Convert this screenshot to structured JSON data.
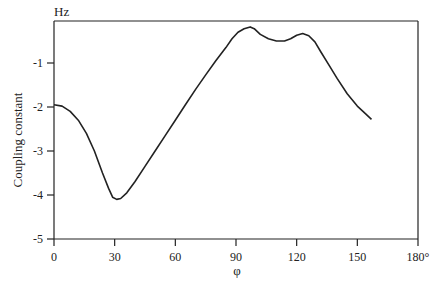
{
  "chart_data": {
    "type": "line",
    "title": "",
    "xlabel": "φ",
    "ylabel": "Coupling constant",
    "yunit": "Hz",
    "xlim": [
      0,
      180
    ],
    "ylim": [
      -5,
      0
    ],
    "x_ticks": [
      {
        "value": 0,
        "label": "0"
      },
      {
        "value": 30,
        "label": "30"
      },
      {
        "value": 60,
        "label": "60"
      },
      {
        "value": 90,
        "label": "90"
      },
      {
        "value": 120,
        "label": "120"
      },
      {
        "value": 150,
        "label": "150"
      },
      {
        "value": 180,
        "label": "180°"
      }
    ],
    "y_ticks": [
      {
        "value": -1,
        "label": "-1"
      },
      {
        "value": -2,
        "label": "-2"
      },
      {
        "value": -3,
        "label": "-3"
      },
      {
        "value": -4,
        "label": "-4"
      },
      {
        "value": -5,
        "label": "-5"
      }
    ],
    "grid": false,
    "legend": null,
    "series": [
      {
        "name": "Coupling constant vs φ",
        "color": "#222222",
        "x": [
          0,
          4,
          8,
          12,
          16,
          20,
          24,
          27,
          29,
          31,
          33,
          36,
          40,
          45,
          50,
          55,
          60,
          65,
          70,
          75,
          80,
          85,
          88,
          91,
          94,
          97,
          99,
          102,
          106,
          110,
          114,
          117,
          120,
          123,
          126,
          129,
          132,
          136,
          140,
          145,
          150,
          154,
          157
        ],
        "values": [
          -1.95,
          -1.98,
          -2.1,
          -2.3,
          -2.6,
          -3.0,
          -3.5,
          -3.85,
          -4.05,
          -4.1,
          -4.08,
          -3.95,
          -3.7,
          -3.35,
          -3.0,
          -2.65,
          -2.3,
          -1.95,
          -1.6,
          -1.27,
          -0.95,
          -0.65,
          -0.45,
          -0.3,
          -0.22,
          -0.18,
          -0.22,
          -0.35,
          -0.45,
          -0.5,
          -0.5,
          -0.45,
          -0.37,
          -0.33,
          -0.38,
          -0.52,
          -0.75,
          -1.05,
          -1.35,
          -1.7,
          -1.98,
          -2.15,
          -2.28
        ]
      }
    ]
  }
}
